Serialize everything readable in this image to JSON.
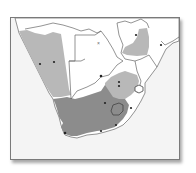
{
  "map": {
    "region": "Southern Africa",
    "colors": {
      "ocean": "#f4f4f4",
      "land": "#ffffff",
      "range_light": "#b8b8b8",
      "range_dark": "#8c8c8c",
      "border": "#666666",
      "point": "#222222"
    },
    "legend": []
  }
}
